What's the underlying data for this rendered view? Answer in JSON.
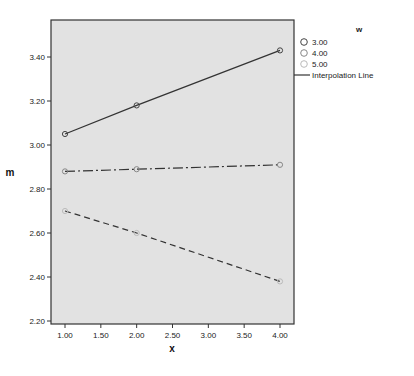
{
  "chart_data": {
    "type": "line",
    "title": "",
    "xlabel": "x",
    "ylabel": "m",
    "xlim": [
      0.85,
      4.15
    ],
    "ylim": [
      2.195,
      3.56
    ],
    "x_ticks": [
      "1.00",
      "1.50",
      "2.00",
      "2.50",
      "3.00",
      "3.50",
      "4.00"
    ],
    "y_ticks": [
      "2.20",
      "2.40",
      "2.60",
      "2.80",
      "3.00",
      "3.20",
      "3.40"
    ],
    "grid": false,
    "legend_position": "right",
    "legend_title": "w",
    "series": [
      {
        "name": "3.00",
        "x": [
          1,
          2,
          4
        ],
        "values": [
          3.05,
          3.18,
          3.43
        ],
        "line_style": "solid",
        "marker_color": "#444444"
      },
      {
        "name": "4.00",
        "x": [
          1,
          2,
          4
        ],
        "values": [
          2.88,
          2.89,
          2.91
        ],
        "line_style": "dash-dot",
        "marker_color": "#888888"
      },
      {
        "name": "5.00",
        "x": [
          1,
          2,
          4
        ],
        "values": [
          2.7,
          2.6,
          2.38
        ],
        "line_style": "dashed",
        "marker_color": "#bbbbbb"
      }
    ],
    "legend_entries": [
      "3.00",
      "4.00",
      "5.00",
      "Interpolation Line"
    ]
  },
  "colors": {
    "plot_background": "#e2e2e2",
    "line": "#333333",
    "frame": "#333333"
  }
}
